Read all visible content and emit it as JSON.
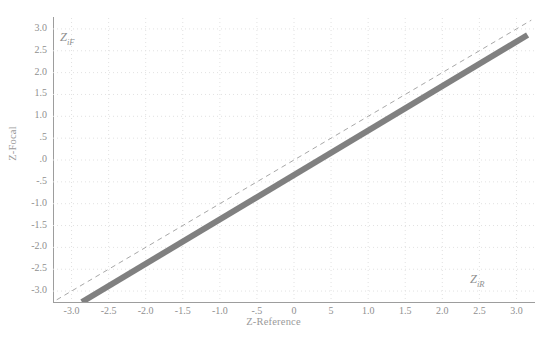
{
  "chart_data": {
    "type": "line",
    "title": "",
    "subtitle": "",
    "xlabel": "Z-Reference",
    "ylabel": "Z-Focal",
    "xlim": [
      -3.25,
      3.25
    ],
    "ylim": [
      -3.25,
      3.25
    ],
    "grid": true,
    "grid_style": "dotted",
    "legend_position": "none",
    "x_ticks": [
      "-3.0",
      "-2.5",
      "-2.0",
      "-1.5",
      "-1.0",
      "-.5",
      "0",
      "5",
      "1.0",
      "1.5",
      "2.0",
      "2.5",
      "3.0"
    ],
    "x_tick_values": [
      -3.0,
      -2.5,
      -2.0,
      -1.5,
      -1.0,
      -0.5,
      0.0,
      0.5,
      1.0,
      1.5,
      2.0,
      2.5,
      3.0
    ],
    "y_ticks": [
      "3.0",
      "2.5",
      "2.0",
      "1.5",
      "1.0",
      ".5",
      ".0",
      "-.5",
      "-1.0",
      "-1.5",
      "-2.0",
      "-2.5",
      "-3.0"
    ],
    "y_tick_values": [
      3.0,
      2.5,
      2.0,
      1.5,
      1.0,
      0.5,
      0.0,
      -0.5,
      -1.0,
      -1.5,
      -2.0,
      -2.5,
      -3.0
    ],
    "annotations": [
      {
        "name": "z-if-label",
        "text": "Z",
        "sub": "iF",
        "x": -2.9,
        "y": 2.65
      },
      {
        "name": "z-ir-label",
        "text": "Z",
        "sub": "iR",
        "x": 2.75,
        "y": -2.55
      }
    ],
    "series": [
      {
        "name": "Reference line (identity)",
        "style": "dashed",
        "color": "#a8a8a8",
        "width": 1,
        "x": [
          -3.2,
          3.2
        ],
        "values": [
          -3.2,
          3.2
        ]
      },
      {
        "name": "Focal vs Reference data band",
        "style": "solid",
        "color": "#808080",
        "width": 6,
        "x": [
          -2.86,
          3.15
        ],
        "values": [
          -3.25,
          2.86
        ]
      }
    ]
  },
  "axes": {
    "x_title": "Z-Reference",
    "y_title": "Z-Focal"
  },
  "colors": {
    "background": "#ffffff",
    "axis": "#9d9d9d",
    "grid": "#e2e2e2",
    "tick_text": "#8f8f8f",
    "data_line": "#808080",
    "reference_line": "#a8a8a8"
  }
}
